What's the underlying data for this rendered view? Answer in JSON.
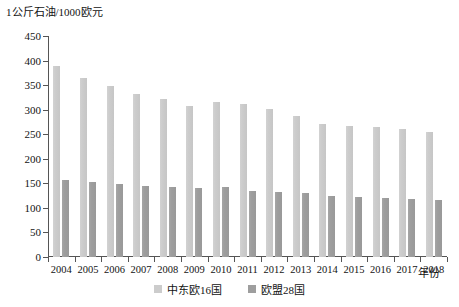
{
  "chart_data": {
    "type": "bar",
    "title": "",
    "subtitle": "",
    "ylabel": "1公斤石油/1000欧元",
    "xlabel": "年份",
    "categories": [
      "2004",
      "2005",
      "2006",
      "2007",
      "2008",
      "2009",
      "2010",
      "2011",
      "2012",
      "2013",
      "2014",
      "2015",
      "2016",
      "2017",
      "2018"
    ],
    "series": [
      {
        "name": "中东欧16国",
        "color": "#cccccc",
        "values": [
          389,
          364,
          348,
          332,
          322,
          308,
          315,
          311,
          302,
          288,
          271,
          266,
          264,
          261,
          255
        ]
      },
      {
        "name": "欧盟28国",
        "color": "#9e9e9e",
        "values": [
          156,
          152,
          149,
          144,
          142,
          141,
          143,
          134,
          133,
          130,
          125,
          123,
          121,
          119,
          116
        ]
      }
    ],
    "ylim": [
      0,
      450
    ],
    "yticks": [
      0,
      50,
      100,
      150,
      200,
      250,
      300,
      350,
      400,
      450
    ],
    "grid": false,
    "legend_position": "bottom-center"
  },
  "legend": {
    "items": [
      {
        "label": "中东欧16国"
      },
      {
        "label": "欧盟28国"
      }
    ]
  }
}
